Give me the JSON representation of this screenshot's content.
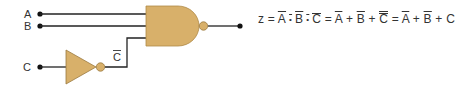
{
  "colors": {
    "gate_fill": "#d8b06a",
    "gate_stroke": "#9a7a40",
    "wire": "#222222",
    "text": "#333333"
  },
  "inputs": [
    {
      "name": "A",
      "label": "A"
    },
    {
      "name": "B",
      "label": "B"
    },
    {
      "name": "C",
      "label": "C"
    }
  ],
  "gates": [
    {
      "type": "NAND",
      "inputs": [
        "A",
        "B",
        "C̄"
      ],
      "output": "z"
    },
    {
      "type": "NOT",
      "inputs": [
        "C"
      ],
      "output": "C̄"
    }
  ],
  "labels": {
    "c_bar_letter": "C"
  },
  "equation": {
    "lhs": "z",
    "eq": "=",
    "term1": {
      "a": "A",
      "dot1": "•",
      "b": "B",
      "dot2": "•",
      "c": "C"
    },
    "term2": {
      "a": "A",
      "plus1": "+",
      "b": "B",
      "plus2": "+",
      "c": "C"
    },
    "term3": {
      "a": "A",
      "plus1": "+",
      "b": "B",
      "plus2": "+",
      "c": "C"
    },
    "full_text": "z = ¬(A·B·C̄) = Ā + B̄ + C̿ = Ā + B̄ + C"
  }
}
